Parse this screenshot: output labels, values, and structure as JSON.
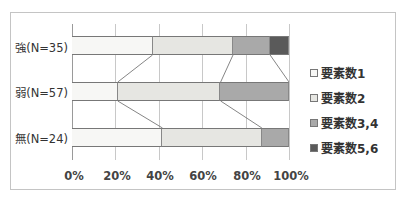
{
  "chart_data": {
    "type": "bar",
    "orientation": "horizontal",
    "stacked": "percent",
    "title": "",
    "xlabel": "",
    "ylabel": "",
    "xlim": [
      0,
      100
    ],
    "x_ticks": [
      "0%",
      "20%",
      "40%",
      "60%",
      "80%",
      "100%"
    ],
    "grid": true,
    "legend_position": "right",
    "categories": [
      "強(N=35)",
      "弱(N=57)",
      "無(N=24)"
    ],
    "series": [
      {
        "name": "要素数1",
        "color": "#f7f7f5",
        "values": [
          37.1,
          21.1,
          41.7
        ]
      },
      {
        "name": "要素数2",
        "color": "#e6e6e2",
        "values": [
          37.1,
          47.4,
          45.8
        ]
      },
      {
        "name": "要素数3,4",
        "color": "#a9a9a9",
        "values": [
          17.1,
          31.6,
          12.5
        ]
      },
      {
        "name": "要素数5,6",
        "color": "#5a5a5a",
        "values": [
          8.6,
          0.0,
          0.0
        ]
      }
    ],
    "series_lines": true
  },
  "labels": {
    "rows": [
      "強(N=35)",
      "弱(N=57)",
      "無(N=24)"
    ],
    "x_ticks": [
      "0%",
      "20%",
      "40%",
      "60%",
      "80%",
      "100%"
    ],
    "legend": [
      "要素数1",
      "要素数2",
      "要素数3,4",
      "要素数5,6"
    ]
  }
}
